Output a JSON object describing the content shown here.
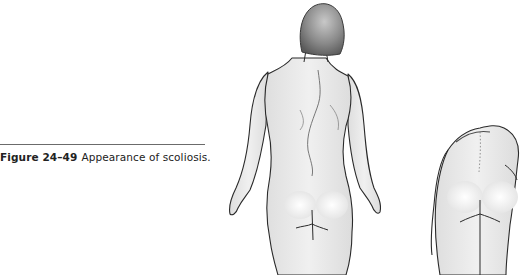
{
  "figure": {
    "label": "Figure 24–49",
    "caption": "Appearance of scoliosis.",
    "panels": [
      {
        "name": "standing-back-view",
        "description": "Woman standing, viewed from behind, showing lateral spinal curvature and uneven shoulders"
      },
      {
        "name": "forward-bend-view",
        "description": "Woman bending forward (Adams forward bend test), showing rib hump"
      }
    ],
    "colors": {
      "skin": "#ececec",
      "outline": "#2a2a2a",
      "hair": "#8c8c8c",
      "rule": "#6b6b6b"
    }
  }
}
